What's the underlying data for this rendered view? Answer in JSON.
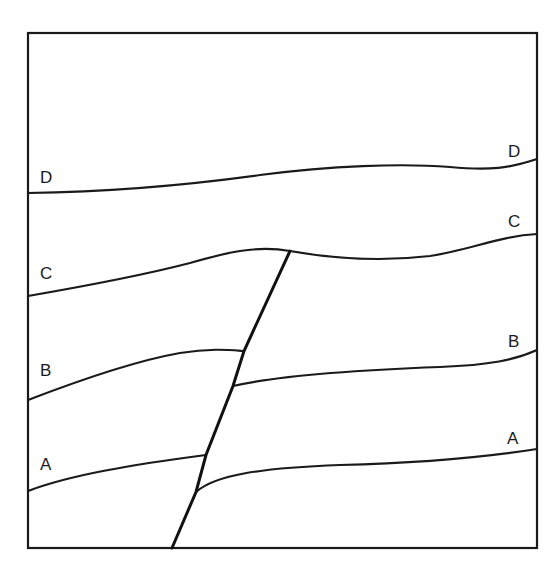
{
  "diagram": {
    "type": "geologic-cross-section",
    "frame": {
      "x": 28,
      "y": 32,
      "width": 509,
      "height": 516
    },
    "labels": {
      "left": {
        "D": "D",
        "C": "C",
        "B": "B",
        "A": "A"
      },
      "right": {
        "D": "D",
        "C": "C",
        "B": "B",
        "A": "A"
      }
    },
    "layers": [
      {
        "name": "D",
        "cut_by_fault": false
      },
      {
        "name": "C",
        "cut_by_fault": false,
        "fault_terminates_at": true
      },
      {
        "name": "B",
        "cut_by_fault": true
      },
      {
        "name": "A",
        "cut_by_fault": true
      }
    ],
    "fault": {
      "top": [
        290,
        251
      ],
      "bottom": [
        172,
        548
      ]
    },
    "colors": {
      "line": "#1a1a1a",
      "background": "#ffffff"
    }
  }
}
